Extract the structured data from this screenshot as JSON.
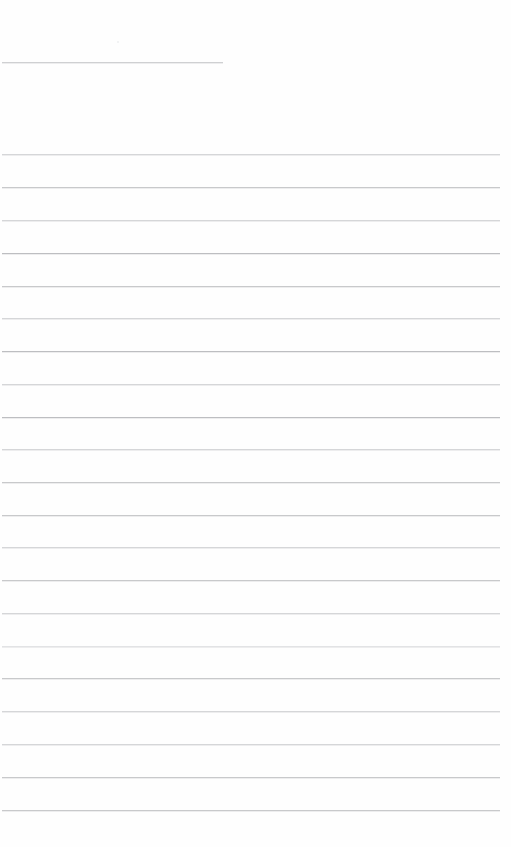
{
  "document": {
    "kind": "scanned-ruled-page",
    "description": "Blank scanned ruled notebook page",
    "page_width": 511,
    "page_height": 847,
    "background_color": "#ffffff",
    "paper_color": "#fefefe",
    "ink_color": "#c6c7c9",
    "content_text": ""
  },
  "heading_rule": {
    "name": "heading-underline",
    "y": 62,
    "x_start": 2,
    "x_end": 223,
    "length": 221,
    "density": "light",
    "color": "#cfd0d2",
    "text_above": ""
  },
  "artifacts": [
    {
      "name": "scan-speck",
      "x": 117,
      "y": 41,
      "size": 2,
      "color": "#eeeff0"
    }
  ],
  "ruling": {
    "line_count": 21,
    "first_line_y": 154,
    "last_line_y": 810,
    "spacing": 32.8,
    "x_start": 2,
    "x_end": 500,
    "lines": [
      {
        "index": 1,
        "y": 154,
        "density": "light",
        "color": "#d5d6d8",
        "text": ""
      },
      {
        "index": 2,
        "y": 187,
        "density": "medium",
        "color": "#c8c9cb",
        "text": ""
      },
      {
        "index": 3,
        "y": 220,
        "density": "light",
        "color": "#d5d6d8",
        "text": ""
      },
      {
        "index": 4,
        "y": 253,
        "density": "strong",
        "color": "#bdbec1",
        "text": ""
      },
      {
        "index": 5,
        "y": 286,
        "density": "medium",
        "color": "#c8c9cb",
        "text": ""
      },
      {
        "index": 6,
        "y": 318,
        "density": "light",
        "color": "#d5d6d8",
        "text": ""
      },
      {
        "index": 7,
        "y": 351,
        "density": "strong",
        "color": "#bdbec1",
        "text": ""
      },
      {
        "index": 8,
        "y": 384,
        "density": "light",
        "color": "#d5d6d8",
        "text": ""
      },
      {
        "index": 9,
        "y": 417,
        "density": "strong",
        "color": "#bdbec1",
        "text": ""
      },
      {
        "index": 10,
        "y": 449,
        "density": "light",
        "color": "#d5d6d8",
        "text": ""
      },
      {
        "index": 11,
        "y": 482,
        "density": "medium",
        "color": "#c8c9cb",
        "text": ""
      },
      {
        "index": 12,
        "y": 515,
        "density": "medium",
        "color": "#c8c9cb",
        "text": ""
      },
      {
        "index": 13,
        "y": 547,
        "density": "light",
        "color": "#d5d6d8",
        "text": ""
      },
      {
        "index": 14,
        "y": 580,
        "density": "medium",
        "color": "#c8c9cb",
        "text": ""
      },
      {
        "index": 15,
        "y": 613,
        "density": "light",
        "color": "#d5d6d8",
        "text": ""
      },
      {
        "index": 16,
        "y": 646,
        "density": "faint",
        "color": "#e2e3e5",
        "text": ""
      },
      {
        "index": 17,
        "y": 678,
        "density": "medium",
        "color": "#c8c9cb",
        "text": ""
      },
      {
        "index": 18,
        "y": 711,
        "density": "light",
        "color": "#d5d6d8",
        "text": ""
      },
      {
        "index": 19,
        "y": 744,
        "density": "light",
        "color": "#d5d6d8",
        "text": ""
      },
      {
        "index": 20,
        "y": 777,
        "density": "medium",
        "color": "#c8c9cb",
        "text": ""
      },
      {
        "index": 21,
        "y": 810,
        "density": "medium",
        "color": "#c8c9cb",
        "text": ""
      }
    ]
  },
  "margins": {
    "top_blank_height": 62,
    "gap_after_heading": 92,
    "bottom_blank_height": 37
  }
}
